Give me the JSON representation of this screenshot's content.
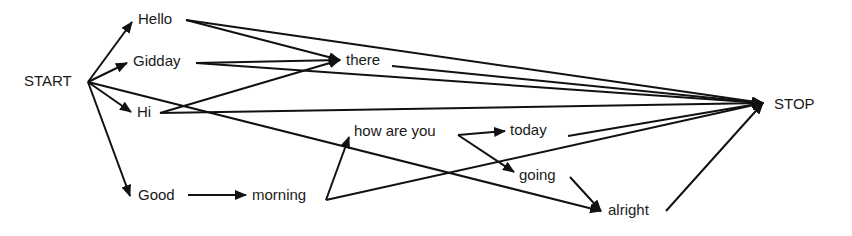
{
  "diagram": {
    "type": "word-lattice",
    "nodes": [
      {
        "id": "start",
        "label": "START",
        "x": 24,
        "y": 72,
        "ax": 88,
        "ay": 82,
        "tx": 88,
        "ty": 82
      },
      {
        "id": "hello",
        "label": "Hello",
        "x": 138,
        "y": 10,
        "ax": 132,
        "ay": 22,
        "tx": 186,
        "ty": 20
      },
      {
        "id": "gidday",
        "label": "Gidday",
        "x": 133,
        "y": 52,
        "ax": 127,
        "ay": 63,
        "tx": 196,
        "ty": 63
      },
      {
        "id": "hi",
        "label": "Hi",
        "x": 137,
        "y": 103,
        "ax": 131,
        "ay": 112,
        "tx": 160,
        "ty": 113
      },
      {
        "id": "there",
        "label": "there",
        "x": 346,
        "y": 51,
        "ax": 340,
        "ay": 60,
        "tx": 392,
        "ty": 66
      },
      {
        "id": "good",
        "label": "Good",
        "x": 138,
        "y": 186,
        "ax": 130,
        "ay": 196,
        "tx": 188,
        "ty": 195
      },
      {
        "id": "morning",
        "label": "morning",
        "x": 252,
        "y": 186,
        "ax": 246,
        "ay": 195,
        "tx": 326,
        "ty": 200
      },
      {
        "id": "howareyou",
        "label": "how are you",
        "x": 354,
        "y": 122,
        "ax": 349,
        "ay": 137,
        "tx": 458,
        "ty": 135
      },
      {
        "id": "today",
        "label": "today",
        "x": 510,
        "y": 121,
        "ax": 505,
        "ay": 131,
        "tx": 568,
        "ty": 136
      },
      {
        "id": "going",
        "label": "going",
        "x": 519,
        "y": 166,
        "ax": 514,
        "ay": 172,
        "tx": 570,
        "ty": 177
      },
      {
        "id": "alright",
        "label": "alright",
        "x": 608,
        "y": 201,
        "ax": 601,
        "ay": 211,
        "tx": 666,
        "ty": 211
      },
      {
        "id": "stop",
        "label": "STOP",
        "x": 774,
        "y": 95,
        "ax": 763,
        "ay": 103,
        "tx": 763,
        "ty": 103
      }
    ],
    "edges": [
      {
        "from": "start",
        "to": "hello"
      },
      {
        "from": "start",
        "to": "gidday"
      },
      {
        "from": "start",
        "to": "hi"
      },
      {
        "from": "start",
        "to": "good"
      },
      {
        "from": "start",
        "to": "alright"
      },
      {
        "from": "hello",
        "to": "there"
      },
      {
        "from": "hello",
        "to": "stop"
      },
      {
        "from": "gidday",
        "to": "there"
      },
      {
        "from": "gidday",
        "to": "stop"
      },
      {
        "from": "hi",
        "to": "there"
      },
      {
        "from": "hi",
        "to": "stop"
      },
      {
        "from": "there",
        "to": "stop"
      },
      {
        "from": "good",
        "to": "morning"
      },
      {
        "from": "morning",
        "to": "howareyou"
      },
      {
        "from": "morning",
        "to": "stop"
      },
      {
        "from": "howareyou",
        "to": "today"
      },
      {
        "from": "howareyou",
        "to": "going"
      },
      {
        "from": "today",
        "to": "stop"
      },
      {
        "from": "going",
        "to": "alright"
      },
      {
        "from": "alright",
        "to": "stop"
      }
    ],
    "colors": {
      "line": "#111111",
      "text": "#1a1a1a",
      "background": "#ffffff"
    }
  }
}
